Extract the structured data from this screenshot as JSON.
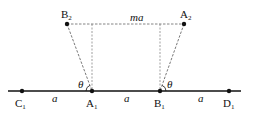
{
  "diagram": {
    "colors": {
      "line": "#111111",
      "dashed": "#666666",
      "background": "#ffffff"
    },
    "points": {
      "C1": {
        "base": "C",
        "sub": "1"
      },
      "A1": {
        "base": "A",
        "sub": "1"
      },
      "B1": {
        "base": "B",
        "sub": "1"
      },
      "D1": {
        "base": "D",
        "sub": "1"
      },
      "B2": {
        "base": "B",
        "sub": "2"
      },
      "A2": {
        "base": "A",
        "sub": "2"
      }
    },
    "segment_labels": {
      "c1_a1": "a",
      "a1_b1": "a",
      "b1_d1": "a",
      "top": "ma"
    },
    "angle_labels": {
      "left": "θ",
      "right": "θ"
    }
  }
}
